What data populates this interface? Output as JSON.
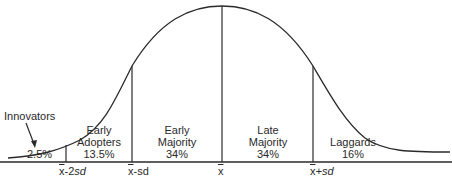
{
  "diagram": {
    "type": "bell-curve",
    "segments": [
      {
        "name": "Innovators",
        "percent": "2.5%"
      },
      {
        "name_lines": [
          "Early",
          "Adopters"
        ],
        "percent": "13.5%"
      },
      {
        "name_lines": [
          "Early",
          "Majority"
        ],
        "percent": "34%"
      },
      {
        "name_lines": [
          "Late",
          "Majority"
        ],
        "percent": "34%"
      },
      {
        "name_lines": [
          "Laggards"
        ],
        "percent": "16%"
      }
    ],
    "axis_ticks": [
      {
        "mean": "x",
        "suffix": "-2",
        "sd": "sd"
      },
      {
        "mean": "x",
        "suffix": "-sd",
        "sd": ""
      },
      {
        "mean": "x",
        "suffix": "",
        "sd": ""
      },
      {
        "mean": "x",
        "suffix": "+",
        "sd": "sd"
      }
    ]
  }
}
